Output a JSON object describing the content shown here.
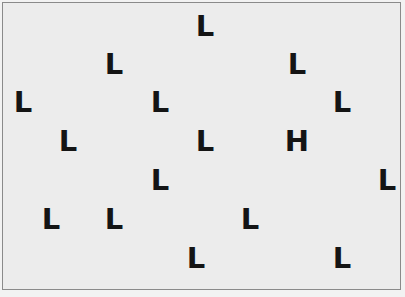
{
  "stimulus": {
    "description": "Visual search display: one target among distractors",
    "target_letter": "H",
    "distractor_letter": "L",
    "text_color": "#141414",
    "background_color": "#ececec",
    "border_color": "#8a8a8a",
    "items": [
      {
        "letter": "L",
        "x": 194,
        "y": 17
      },
      {
        "letter": "L",
        "x": 103,
        "y": 55
      },
      {
        "letter": "L",
        "x": 286,
        "y": 55
      },
      {
        "letter": "L",
        "x": 12,
        "y": 93
      },
      {
        "letter": "L",
        "x": 149,
        "y": 93
      },
      {
        "letter": "L",
        "x": 331,
        "y": 93
      },
      {
        "letter": "L",
        "x": 57,
        "y": 132
      },
      {
        "letter": "L",
        "x": 194,
        "y": 132
      },
      {
        "letter": "H",
        "x": 286,
        "y": 132
      },
      {
        "letter": "L",
        "x": 149,
        "y": 171
      },
      {
        "letter": "L",
        "x": 376,
        "y": 171
      },
      {
        "letter": "L",
        "x": 40,
        "y": 210
      },
      {
        "letter": "L",
        "x": 103,
        "y": 210
      },
      {
        "letter": "L",
        "x": 239,
        "y": 210
      },
      {
        "letter": "L",
        "x": 185,
        "y": 249
      },
      {
        "letter": "L",
        "x": 331,
        "y": 249
      }
    ]
  }
}
